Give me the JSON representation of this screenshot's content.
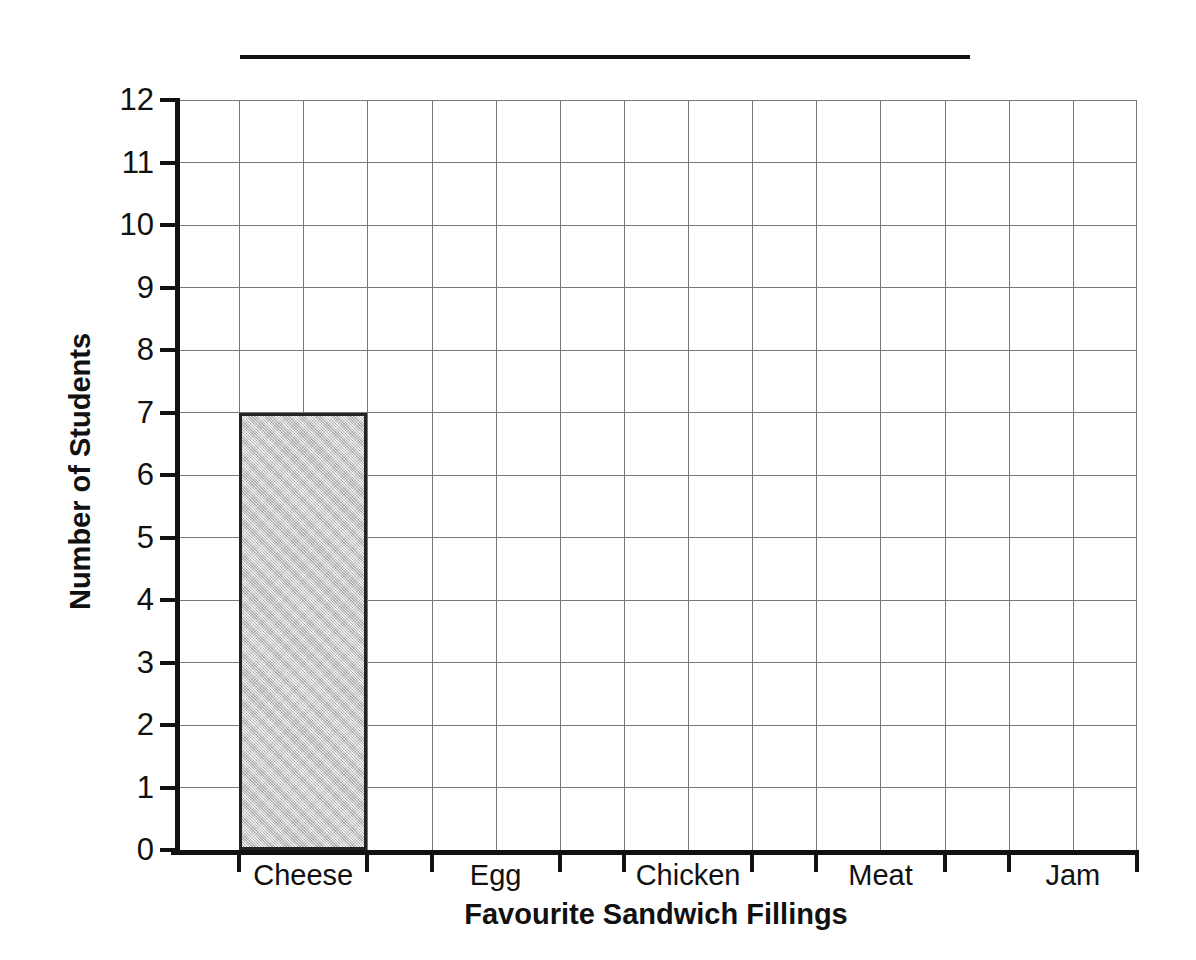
{
  "chart_data": {
    "type": "bar",
    "title": "",
    "title_is_blank_rule": true,
    "xlabel": "Favourite Sandwich Fillings",
    "ylabel": "Number of Students",
    "categories": [
      "Cheese",
      "Egg",
      "Chicken",
      "Meat",
      "Jam"
    ],
    "values": [
      7,
      0,
      0,
      0,
      0
    ],
    "ylim": [
      0,
      12
    ],
    "ytick_labels": [
      "0",
      "1",
      "2",
      "3",
      "4",
      "5",
      "6",
      "7",
      "8",
      "9",
      "10",
      "11",
      "12"
    ],
    "ytick_values": [
      0,
      1,
      2,
      3,
      4,
      5,
      6,
      7,
      8,
      9,
      10,
      11,
      12
    ],
    "grid": true,
    "grid_columns": 15,
    "legend": "none",
    "bar_fill_color": "#c9c9c9",
    "bar_edge_color": "#222222",
    "grid_color": "#777777",
    "axis_color": "#111111"
  }
}
